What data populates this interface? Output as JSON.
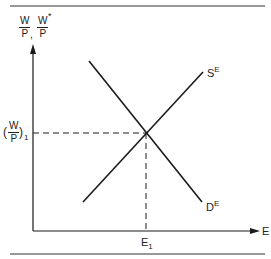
{
  "diagram": {
    "type": "supply-demand",
    "y_axis_label": {
      "left_num": "W",
      "left_den": "P",
      "separator": ",",
      "right_num": "W",
      "right_den": "P",
      "right_star": "*"
    },
    "x_axis_label": "E",
    "equilibrium_wage_label": {
      "open": "(",
      "num": "W",
      "den": "P",
      "close": ")",
      "sub": "1"
    },
    "equilibrium_employment_label": {
      "base": "E",
      "sub": "1"
    },
    "supply_curve_label": {
      "base": "S",
      "sup": "E"
    },
    "demand_curve_label": {
      "base": "D",
      "sup": "E"
    },
    "colors": {
      "line": "#1a1a1a",
      "background": "#ffffff"
    }
  }
}
